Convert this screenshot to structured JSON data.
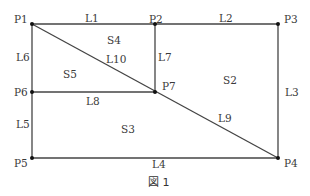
{
  "points": {
    "P1": {
      "label": "P1",
      "x": 32,
      "y": 24
    },
    "P2": {
      "label": "P2",
      "x": 155,
      "y": 24
    },
    "P3": {
      "label": "P3",
      "x": 278,
      "y": 24
    },
    "P4": {
      "label": "P4",
      "x": 278,
      "y": 158
    },
    "P5": {
      "label": "P5",
      "x": 32,
      "y": 158
    },
    "P6": {
      "label": "P6",
      "x": 32,
      "y": 92
    },
    "P7": {
      "label": "P7",
      "x": 155,
      "y": 92
    }
  },
  "lines": {
    "L1": {
      "label": "L1",
      "from": "P1",
      "to": "P2"
    },
    "L2": {
      "label": "L2",
      "from": "P2",
      "to": "P3"
    },
    "L3": {
      "label": "L3",
      "from": "P3",
      "to": "P4"
    },
    "L4": {
      "label": "L4",
      "from": "P5",
      "to": "P4"
    },
    "L5": {
      "label": "L5",
      "from": "P6",
      "to": "P5"
    },
    "L6": {
      "label": "L6",
      "from": "P1",
      "to": "P6"
    },
    "L7": {
      "label": "L7",
      "from": "P2",
      "to": "P7"
    },
    "L8": {
      "label": "L8",
      "from": "P6",
      "to": "P7"
    },
    "L9": {
      "label": "L9",
      "from": "P7",
      "to": "P4"
    },
    "L10": {
      "label": "L10",
      "from": "P1",
      "to": "P7"
    }
  },
  "regions": {
    "S2": {
      "label": "S2"
    },
    "S3": {
      "label": "S3"
    },
    "S4": {
      "label": "S4"
    },
    "S5": {
      "label": "S5"
    }
  },
  "caption": "図 1"
}
